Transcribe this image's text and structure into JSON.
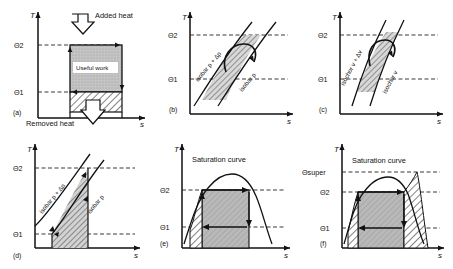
{
  "figure": {
    "type": "temperature-entropy-diagram-set",
    "panel_count": 6,
    "axis_x_label": "s",
    "axis_y_label": "T",
    "colors": {
      "ink": "#111111",
      "fill_gray": "#b9b9b9",
      "hatch": "#1a1a1a",
      "dashed": "#222222",
      "background": "#ffffff"
    }
  },
  "panels": [
    {
      "id": "a",
      "tag": "(a)",
      "axis_x": "s",
      "axis_y": "T",
      "ticks_y": [
        "Θ2",
        "Θ1"
      ],
      "annotations": [
        {
          "name": "added-heat",
          "text": "Added heat",
          "arrow": "down"
        },
        {
          "name": "removed-heat",
          "text": "Removed heat",
          "arrow": "down"
        },
        {
          "name": "useful-work",
          "text": "Useful work"
        }
      ],
      "regions": [
        {
          "name": "useful-work-region",
          "style": "gray"
        },
        {
          "name": "removed-heat-region",
          "style": "hatched"
        }
      ]
    },
    {
      "id": "b",
      "tag": "(b)",
      "axis_x": "s",
      "axis_y": "T",
      "ticks_y": [
        "Θ2",
        "Θ1"
      ],
      "curve_labels": [
        "isobar  p + Δp",
        "isobar  p"
      ],
      "regions": [
        {
          "name": "cycle-area",
          "style": "hatched"
        }
      ]
    },
    {
      "id": "c",
      "tag": "(c)",
      "axis_x": "s",
      "axis_y": "T",
      "ticks_y": [
        "Θ2",
        "Θ1"
      ],
      "curve_labels": [
        "isochor  v + Δv",
        "isochor  v"
      ],
      "regions": [
        {
          "name": "cycle-area",
          "style": "hatched"
        }
      ]
    },
    {
      "id": "d",
      "tag": "(d)",
      "axis_x": "s",
      "axis_y": "T",
      "ticks_y": [
        "Θ2",
        "Θ1"
      ],
      "curve_labels": [
        "isobar  p + Δp",
        "isobar  p"
      ],
      "regions": [
        {
          "name": "cycle-area",
          "style": "hatched"
        }
      ]
    },
    {
      "id": "e",
      "tag": "(e)",
      "axis_x": "s",
      "axis_y": "T",
      "ticks_y": [
        "Θ2",
        "Θ1"
      ],
      "annotations": [
        {
          "name": "saturation-curve",
          "text": "Saturation curve"
        }
      ],
      "regions": [
        {
          "name": "work-region",
          "style": "gray"
        },
        {
          "name": "liquid-region",
          "style": "hatched"
        }
      ]
    },
    {
      "id": "f",
      "tag": "(f)",
      "axis_x": "s",
      "axis_y": "T",
      "ticks_y": [
        "Θsuper",
        "Θ2",
        "Θ1"
      ],
      "annotations": [
        {
          "name": "saturation-curve",
          "text": "Saturation curve"
        }
      ],
      "regions": [
        {
          "name": "work-region",
          "style": "gray"
        },
        {
          "name": "left-hatch-region",
          "style": "hatched"
        },
        {
          "name": "right-hatch-region",
          "style": "hatched"
        }
      ]
    }
  ]
}
